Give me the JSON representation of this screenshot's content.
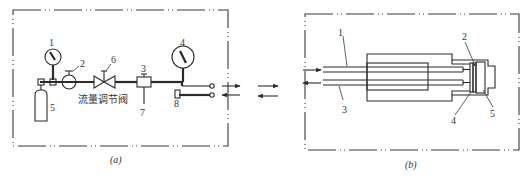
{
  "panel_a": {
    "caption": "(a)",
    "labels": {
      "gauge_1": "1",
      "reducer_2": "2",
      "filter_3": "3",
      "gauge_4": "4",
      "cylinder_5": "5",
      "valve_6": "6",
      "drain_7": "7",
      "part_8": "8"
    },
    "valve_text": "流量调节阀"
  },
  "panel_b": {
    "caption": "(b)",
    "labels": {
      "fiber_1": "1",
      "part_2": "2",
      "fiber_3": "3",
      "part_4": "4",
      "part_5": "5"
    }
  },
  "colors": {
    "line": "#2a2a2a",
    "background": "#ffffff"
  }
}
